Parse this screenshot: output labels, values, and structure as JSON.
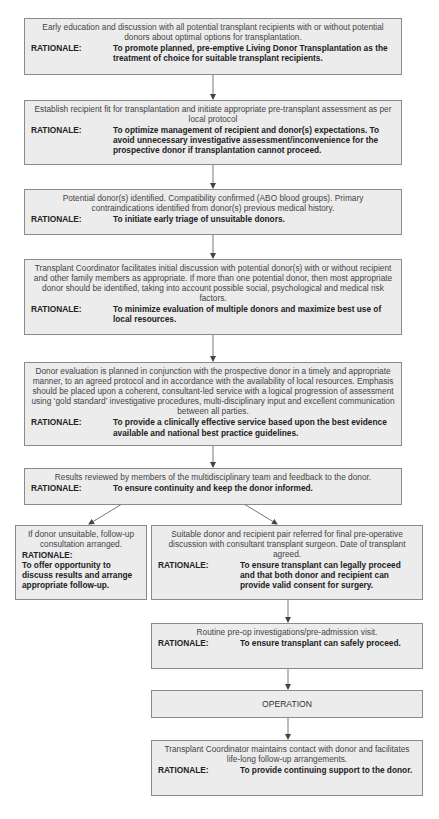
{
  "diagram": {
    "type": "flowchart",
    "rationale_label": "RATIONALE:",
    "steps": [
      {
        "id": "early-education",
        "description": "Early education and discussion with all potential transplant recipients with or without potential donors about optimal options for transplantation.",
        "rationale": "To promote planned, pre-emptive Living Donor Transplantation as the treatment of choice for suitable transplant recipients."
      },
      {
        "id": "recipient-fit",
        "description": "Establish recipient fit for transplantation and initiate appropriate pre-transplant assessment as per local protocol",
        "rationale": "To optimize management of recipient and donor(s) expectations. To avoid unnecessary investigative assessment/inconvenience for the prospective donor if transplantation cannot proceed."
      },
      {
        "id": "donor-identified",
        "description": "Potential donor(s) identified. Compatibility confirmed (ABO blood groups). Primary contraindications identified from donor(s) previous medical history.",
        "rationale": "To initiate early triage of unsuitable donors."
      },
      {
        "id": "coordinator-discussion",
        "description": "Transplant Coordinator facilitates initial discussion with potential donor(s) with or without recipient and other family members as appropriate. If more than one potential donor, then most appropriate donor should be identified, taking into account possible social, psychological and medical risk factors.",
        "rationale": "To minimize evaluation of multiple donors and maximize best use of local resources."
      },
      {
        "id": "donor-evaluation",
        "description": "Donor evaluation is planned in conjunction with the prospective donor in a timely and appropriate manner, to an agreed protocol and in accordance with the availability of local resources. Emphasis should be placed upon a coherent, consultant-led service with a logical progression of assessment using ‘gold standard’ investigative procedures, multi-disciplinary input and excellent communication between all parties.",
        "rationale": "To provide a clinically effective service based upon the best evidence available and national best practice guidelines."
      },
      {
        "id": "results-reviewed",
        "description": "Results reviewed by members of the multidisciplinary team and feedback to the donor.",
        "rationale": "To ensure continuity and keep the donor informed."
      },
      {
        "id": "donor-unsuitable",
        "description": "If donor unsuitable, follow-up consultation arranged.",
        "rationale": "To offer opportunity to discuss results and arrange appropriate follow-up."
      },
      {
        "id": "pair-referred",
        "description": "Suitable donor and recipient pair referred for final pre-operative discussion with consultant transplant surgeon. Date of transplant agreed.",
        "rationale": "To ensure transplant can legally proceed and that both donor and recipient can provide valid consent for surgery."
      },
      {
        "id": "pre-op",
        "description": "Routine pre-op investigations/pre-admission visit.",
        "rationale": "To ensure transplant can safely proceed."
      },
      {
        "id": "operation",
        "description": "OPERATION"
      },
      {
        "id": "follow-up",
        "description": "Transplant Coordinator maintains contact with donor and facilitates life-long follow-up arrangements.",
        "rationale": "To provide continuing support to the donor."
      }
    ],
    "edges": [
      [
        "early-education",
        "recipient-fit"
      ],
      [
        "recipient-fit",
        "donor-identified"
      ],
      [
        "donor-identified",
        "coordinator-discussion"
      ],
      [
        "coordinator-discussion",
        "donor-evaluation"
      ],
      [
        "donor-evaluation",
        "results-reviewed"
      ],
      [
        "results-reviewed",
        "donor-unsuitable"
      ],
      [
        "results-reviewed",
        "pair-referred"
      ],
      [
        "pair-referred",
        "pre-op"
      ],
      [
        "pre-op",
        "operation"
      ],
      [
        "operation",
        "follow-up"
      ]
    ],
    "colors": {
      "box_fill": "#ececec",
      "box_border": "#8a8a8a",
      "arrow": "#444444",
      "background": "#ffffff"
    }
  }
}
